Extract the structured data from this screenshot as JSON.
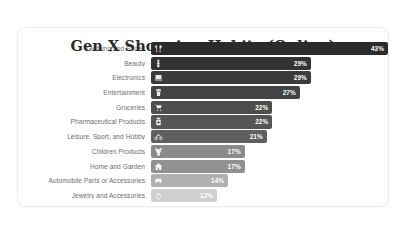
{
  "chart_data": {
    "type": "bar",
    "orientation": "horizontal",
    "title": "Gen X Shopping Habits (Online)",
    "xlabel": "",
    "ylabel": "",
    "unit": "%",
    "xlim": [
      0,
      43
    ],
    "grid": false,
    "legend": false,
    "categories": [
      "Clothing and Shoes",
      "Beauty",
      "Electronics",
      "Entertainment",
      "Groceries",
      "Pharmaceutical Products",
      "Leisure, Sport, and Hobby",
      "Children Products",
      "Home and Garden",
      "Automobile Parts or Accessories",
      "Jewelry and Accessories"
    ],
    "values": [
      43,
      29,
      29,
      27,
      22,
      22,
      21,
      17,
      17,
      14,
      12
    ],
    "value_labels": [
      "43%",
      "29%",
      "29%",
      "27%",
      "22%",
      "22%",
      "21%",
      "17%",
      "17%",
      "14%",
      "12%"
    ],
    "bar_colors": [
      "#2b2b2b",
      "#333333",
      "#3b3b3b",
      "#434343",
      "#4d4d4d",
      "#555555",
      "#5f5f5f",
      "#8a8a8a",
      "#919191",
      "#b0b0b0",
      "#cfcfcf"
    ],
    "bar_icons": [
      "tshirt-icon",
      "lipstick-icon",
      "laptop-icon",
      "popcorn-icon",
      "shopping-cart-icon",
      "pill-bottle-icon",
      "bicycle-icon",
      "teddy-bear-icon",
      "house-icon",
      "car-icon",
      "ring-icon"
    ]
  },
  "colors": {
    "card_background": "#ffffff",
    "card_border": "#ececec",
    "page_background": "#ffffff",
    "title_text": "#2b2b2b",
    "label_text": "#6e6e6e",
    "value_text": "#ffffff"
  }
}
